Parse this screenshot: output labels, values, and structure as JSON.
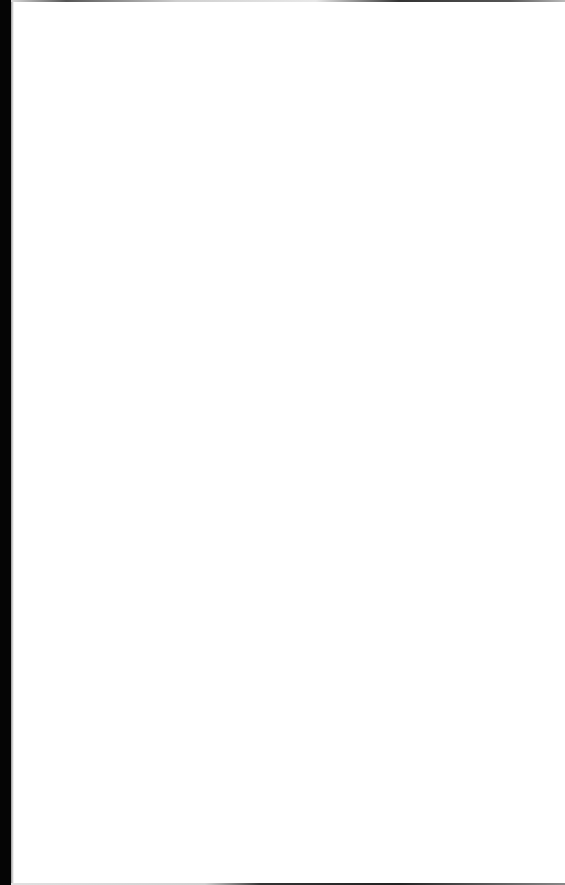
{
  "document": {
    "type": "blank-page",
    "background_color": "#ffffff",
    "edge_color": "#050505",
    "text_content": []
  }
}
